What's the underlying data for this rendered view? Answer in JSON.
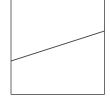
{
  "diagram": {
    "frame": {
      "left": 11,
      "right": 104.5,
      "top": 0,
      "bottom": 94.5,
      "stroke": "#6b6b6b"
    },
    "line": {
      "x1": 11,
      "y1": 61,
      "x2": 104.5,
      "y2": 31,
      "stroke": "#4a4a4a"
    }
  }
}
